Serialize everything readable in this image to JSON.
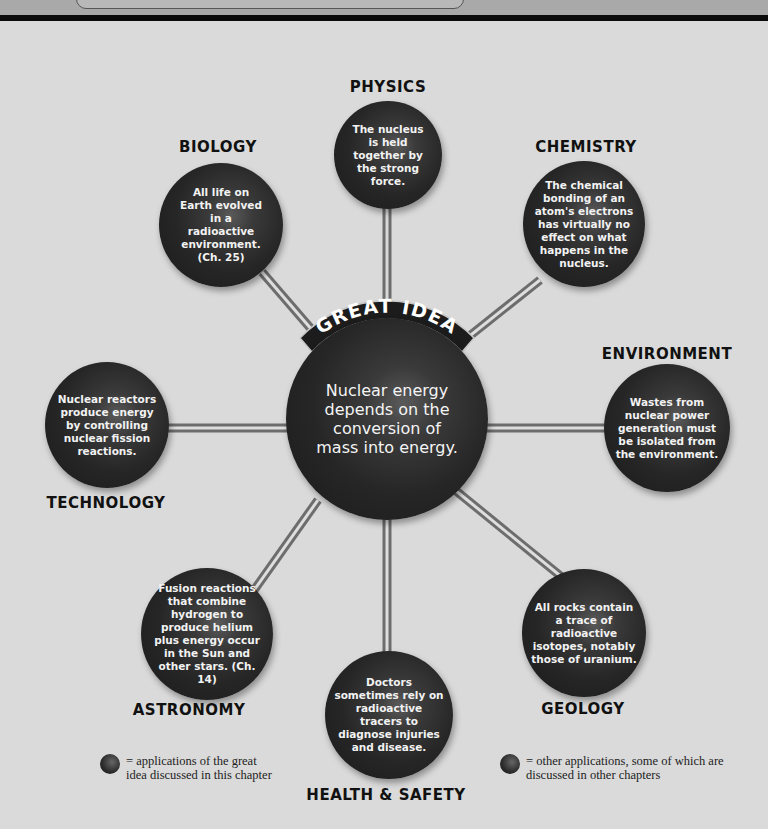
{
  "header": {
    "band_color": "#a9a9a9",
    "bar_color": "#0b0b0b"
  },
  "diagram": {
    "title_banner": "GREAT IDEA",
    "center": {
      "text": "Nuclear energy depends on the conversion of mass into energy."
    },
    "nodes": [
      {
        "id": "physics",
        "label": "PHYSICS",
        "text": "The nucleus is held together by the strong force."
      },
      {
        "id": "biology",
        "label": "BIOLOGY",
        "text": "All life on Earth evolved in a radioactive environment. (Ch. 25)"
      },
      {
        "id": "chemistry",
        "label": "CHEMISTRY",
        "text": "The chemical bonding of an atom's electrons has virtually no effect on what happens in the nucleus."
      },
      {
        "id": "environment",
        "label": "ENVIRONMENT",
        "text": "Wastes from nuclear power generation must be isolated from the environment."
      },
      {
        "id": "technology",
        "label": "TECHNOLOGY",
        "text": "Nuclear reactors produce energy by controlling nuclear fission reactions."
      },
      {
        "id": "astronomy",
        "label": "ASTRONOMY",
        "text": "Fusion reactions that combine hydrogen to produce helium plus energy occur in the Sun and other stars. (Ch. 14)"
      },
      {
        "id": "health",
        "label": "HEALTH & SAFETY",
        "text": "Doctors sometimes rely on radioactive tracers to diagnose injuries and disease."
      },
      {
        "id": "geology",
        "label": "GEOLOGY",
        "text": "All rocks contain a trace of radioactive isotopes, notably those of uranium."
      }
    ]
  },
  "legend": [
    {
      "icon": "sphere-icon",
      "text": "= applications of the great idea discussed in this chapter"
    },
    {
      "icon": "sphere-icon",
      "text": "= other applications, some of which are discussed in other chapters"
    }
  ],
  "colors": {
    "background": "#dadada",
    "sphere": "#262626",
    "label": "#111111",
    "rod": "#9a9a9a"
  }
}
